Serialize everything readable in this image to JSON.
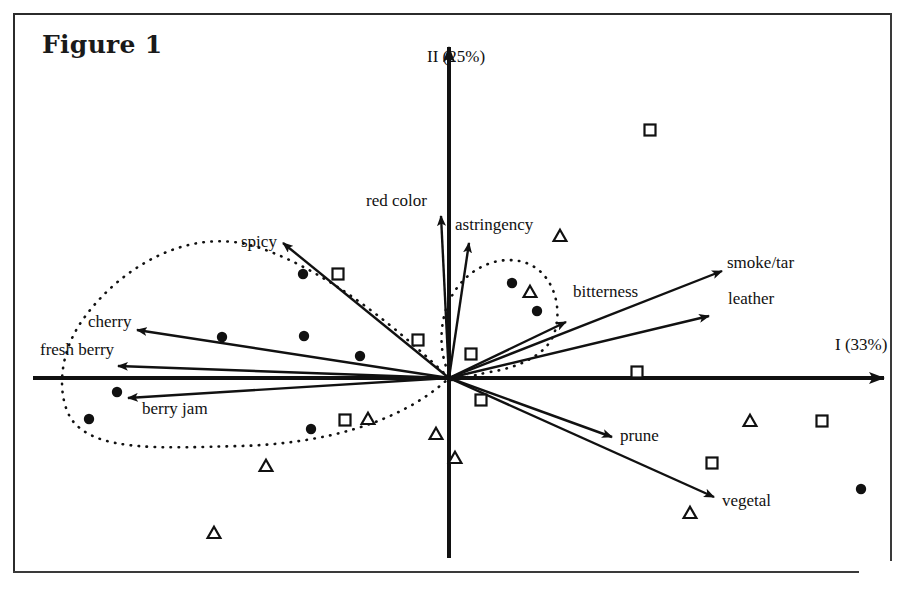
{
  "figure": {
    "title": "Figure 1",
    "type": "PCA biplot / sensory map"
  },
  "axes": {
    "x_label": "I (33%)",
    "y_label": "II (25%)",
    "origin_px": [
      449,
      378
    ]
  },
  "chart_data": {
    "type": "scatter",
    "title": "Figure 1",
    "xlabel": "I (33%)",
    "ylabel": "II (25%)",
    "xlim": [
      -1,
      1
    ],
    "ylim": [
      -1,
      1
    ],
    "grid": false,
    "legend_position": "none",
    "axis_style": "crossed-arrows-through-origin",
    "variable_vectors": [
      {
        "label": "red color",
        "tip_px": [
          441,
          216
        ],
        "dx": -8,
        "dy": -162
      },
      {
        "label": "spicy",
        "tip_px": [
          283,
          243
        ],
        "dx": -166,
        "dy": -135
      },
      {
        "label": "astringency",
        "tip_px": [
          469,
          243
        ],
        "dx": 20,
        "dy": -135
      },
      {
        "label": "bitterness",
        "tip_px": [
          566,
          322
        ],
        "dx": 117,
        "dy": -56
      },
      {
        "label": "smoke/tar",
        "tip_px": [
          722,
          271
        ],
        "dx": 273,
        "dy": -107
      },
      {
        "label": "leather",
        "tip_px": [
          709,
          316
        ],
        "dx": 260,
        "dy": -62
      },
      {
        "label": "cherry",
        "tip_px": [
          137,
          330
        ],
        "dx": -312,
        "dy": -48
      },
      {
        "label": "fresh berry",
        "tip_px": [
          118,
          366
        ],
        "dx": -331,
        "dy": -12
      },
      {
        "label": "berry jam",
        "tip_px": [
          128,
          398
        ],
        "dx": -321,
        "dy": 20
      },
      {
        "label": "prune",
        "tip_px": [
          612,
          437
        ],
        "dx": 163,
        "dy": 59
      },
      {
        "label": "vegetal",
        "tip_px": [
          714,
          497
        ],
        "dx": 265,
        "dy": 119
      }
    ],
    "label_positions_px": {
      "red color": [
        366,
        206
      ],
      "spicy": [
        241,
        247
      ],
      "astringency": [
        455,
        230
      ],
      "bitterness": [
        573,
        297
      ],
      "smoke/tar": [
        727,
        268
      ],
      "leather": [
        728,
        304
      ],
      "cherry": [
        88,
        327
      ],
      "fresh berry": [
        40,
        355
      ],
      "berry jam": [
        142,
        414
      ],
      "prune": [
        620,
        441
      ],
      "vegetal": [
        722,
        506
      ],
      "I (33%)": [
        835,
        350
      ],
      "II (25%)": [
        427,
        62
      ]
    },
    "series": [
      {
        "name": "circle-samples",
        "marker": "filled-circle",
        "points_px": [
          [
            303,
            274
          ],
          [
            222,
            337
          ],
          [
            304,
            336
          ],
          [
            360,
            356
          ],
          [
            117,
            392
          ],
          [
            89,
            419
          ],
          [
            311,
            429
          ],
          [
            512,
            283
          ],
          [
            537,
            311
          ],
          [
            861,
            489
          ]
        ]
      },
      {
        "name": "square-samples",
        "marker": "open-square",
        "points_px": [
          [
            650,
            130
          ],
          [
            338,
            274
          ],
          [
            418,
            340
          ],
          [
            471,
            354
          ],
          [
            481,
            400
          ],
          [
            637,
            372
          ],
          [
            345,
            420
          ],
          [
            712,
            463
          ],
          [
            822,
            421
          ]
        ]
      },
      {
        "name": "triangle-samples",
        "marker": "open-triangle",
        "points_px": [
          [
            560,
            236
          ],
          [
            530,
            292
          ],
          [
            368,
            419
          ],
          [
            436,
            434
          ],
          [
            455,
            458
          ],
          [
            266,
            466
          ],
          [
            214,
            533
          ],
          [
            690,
            513
          ],
          [
            750,
            421
          ]
        ]
      }
    ],
    "grouping_regions": [
      {
        "name": "left-group-dotted-outline",
        "style": "dotted",
        "path": "M 449 378 C 400 330 330 272 260 248 C 190 224 120 268 84 318 C 56 356 58 400 72 420 C 96 452 160 448 240 446 C 320 444 400 424 449 378 Z"
      },
      {
        "name": "right-group-dotted-outline",
        "style": "dotted",
        "path": "M 452 380 C 436 352 438 310 460 284 C 482 258 516 254 536 268 C 556 282 562 312 554 334 C 546 356 516 368 490 372 C 470 376 458 380 452 380 Z"
      }
    ]
  }
}
